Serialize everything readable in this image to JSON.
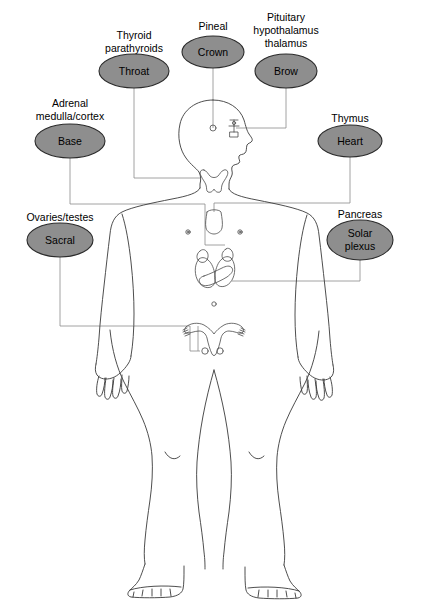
{
  "figure": {
    "colors": {
      "chakra_fill": "#8e8e8e",
      "chakra_stroke": "#2b2b2b",
      "body_outline": "#3a3a3a",
      "organ_outline": "#4a4a4a",
      "connector": "#8a8a8a",
      "background": "#ffffff",
      "text": "#000000"
    }
  },
  "chakras": [
    {
      "id": "throat",
      "chakra_label": "Throat",
      "gland_caption": [
        "Thyroid",
        "parathyroids"
      ],
      "ellipse": {
        "cx": 134,
        "cy": 71,
        "rx": 35,
        "ry": 17
      },
      "caption_x": 134,
      "caption_y_start": 35,
      "side": "left"
    },
    {
      "id": "crown",
      "chakra_label": "Crown",
      "gland_caption": [
        "Pineal"
      ],
      "ellipse": {
        "cx": 213,
        "cy": 52,
        "rx": 31,
        "ry": 16
      },
      "caption_x": 213,
      "caption_y_start": 28,
      "side": "center"
    },
    {
      "id": "brow",
      "chakra_label": "Brow",
      "gland_caption": [
        "Pituitary",
        "hypothalamus",
        "thalamus"
      ],
      "ellipse": {
        "cx": 286,
        "cy": 71,
        "rx": 31,
        "ry": 17
      },
      "caption_x": 286,
      "caption_y_start": 22,
      "side": "right"
    },
    {
      "id": "base",
      "chakra_label": "Base",
      "gland_caption": [
        "Adrenal",
        "medulla/cortex"
      ],
      "ellipse": {
        "cx": 70,
        "cy": 141,
        "rx": 35,
        "ry": 17
      },
      "caption_x": 70,
      "caption_y_start": 105,
      "side": "left"
    },
    {
      "id": "heart",
      "chakra_label": "Heart",
      "gland_caption": [
        "Thymus"
      ],
      "ellipse": {
        "cx": 350,
        "cy": 141,
        "rx": 32,
        "ry": 16
      },
      "caption_x": 350,
      "caption_y_start": 120,
      "side": "right"
    },
    {
      "id": "sacral",
      "chakra_label": "Sacral",
      "gland_caption": [
        "Ovaries/testes"
      ],
      "ellipse": {
        "cx": 60,
        "cy": 240,
        "rx": 33,
        "ry": 17
      },
      "caption_x": 60,
      "caption_y_start": 219,
      "side": "left"
    },
    {
      "id": "solar-plexus",
      "chakra_label": "Solar plexus",
      "chakra_label_lines": [
        "Solar",
        "plexus"
      ],
      "gland_caption": [
        "Pancreas"
      ],
      "ellipse": {
        "cx": 360,
        "cy": 240,
        "rx": 33,
        "ry": 20
      },
      "caption_x": 360,
      "caption_y_start": 218,
      "side": "right"
    }
  ],
  "organs": [
    {
      "id": "pineal-gland",
      "name": "Pineal gland",
      "marker": "circle",
      "cx": 213,
      "cy": 128,
      "r": 3
    },
    {
      "id": "pituitary-hypothalamus",
      "name": "Pituitary / hypothalamus / thalamus",
      "marker": "stack",
      "cx": 234,
      "cy": 128
    },
    {
      "id": "thyroid-gland",
      "name": "Thyroid and parathyroid glands",
      "marker": "butterfly",
      "cx": 212,
      "cy": 175
    },
    {
      "id": "thymus-gland",
      "name": "Thymus gland",
      "marker": "shield",
      "cx": 214,
      "cy": 217
    },
    {
      "id": "adrenal-glands",
      "name": "Adrenal glands",
      "marker": "paired-caps",
      "cx": 214,
      "cy": 262
    },
    {
      "id": "pancreas-organ",
      "name": "Pancreas",
      "marker": "elongated",
      "cx": 218,
      "cy": 278
    },
    {
      "id": "navel-mark",
      "name": "Navel",
      "marker": "small-circle",
      "cx": 214,
      "cy": 304
    },
    {
      "id": "uterus-ovaries",
      "name": "Uterus and ovaries",
      "marker": "uterus",
      "cx": 214,
      "cy": 328
    },
    {
      "id": "testes",
      "name": "Testes",
      "marker": "pair-circles",
      "cx": 214,
      "cy": 350
    }
  ]
}
